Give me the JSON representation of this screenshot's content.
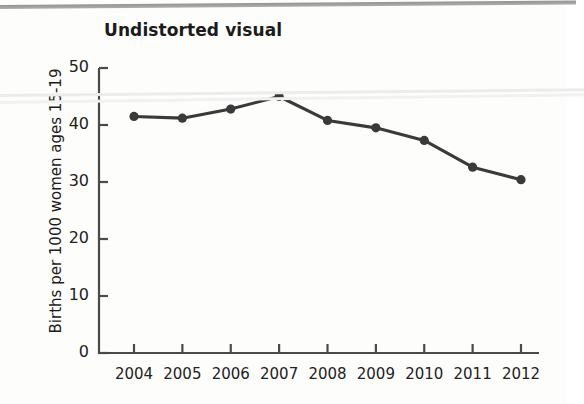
{
  "chart_data": {
    "type": "line",
    "title": "Undistorted visual",
    "xlabel": "",
    "ylabel": "Births per 1000 women ages 15-19",
    "categories": [
      "2004",
      "2005",
      "2006",
      "2007",
      "2008",
      "2009",
      "2010",
      "2011",
      "2012"
    ],
    "values": [
      41.5,
      41.2,
      42.8,
      45.0,
      40.8,
      39.5,
      37.3,
      32.6,
      30.4
    ],
    "series": [
      {
        "name": "Births per 1000 women ages 15-19",
        "values": [
          41.5,
          41.2,
          42.8,
          45.0,
          40.8,
          39.5,
          37.3,
          32.6,
          30.4
        ]
      }
    ],
    "ylim": [
      0,
      50
    ],
    "yticks": [
      "0",
      "10",
      "20",
      "30",
      "40",
      "50"
    ],
    "ytick_values": [
      0,
      10,
      20,
      30,
      40,
      50
    ],
    "xticks": [
      "2004",
      "2005",
      "2006",
      "2007",
      "2008",
      "2009",
      "2010",
      "2011",
      "2012"
    ],
    "grid": false,
    "legend": "none",
    "marker": "circle",
    "line_color": "#3a3a3a",
    "marker_color": "#3a3a3a",
    "axis_color": "#4a4a4a",
    "text_color": "#1b1b1b",
    "background_color": "#fdfdfc"
  },
  "artifacts": {
    "top_rule_color": "#8d8d8d",
    "faint_line_color": "#ececec"
  }
}
